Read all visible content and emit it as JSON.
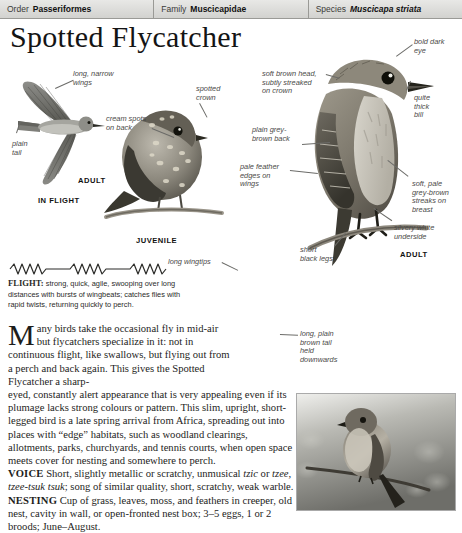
{
  "header": {
    "cells": [
      {
        "label": "Order",
        "value": "Passeriformes",
        "italic": false
      },
      {
        "label": "Family",
        "value": "Muscicapidae",
        "italic": false
      },
      {
        "label": "Species",
        "value": "Muscicapa striata",
        "italic": true
      }
    ]
  },
  "page_title": "Spotted Flycatcher",
  "annotations": {
    "long_narrow_wings": "long, narrow\nwings",
    "plain_tail": "plain\ntail",
    "in_flight": "IN FLIGHT",
    "adult_flight": "ADULT",
    "spotted_crown": "spotted\ncrown",
    "cream_spots_on_back": "cream spots\non back",
    "juvenile": "JUVENILE",
    "bold_dark_eye": "bold dark\neye",
    "soft_brown_head": "soft brown head,\nsubtly streaked\non crown",
    "quite_thick_bill": "quite\nthick\nbill",
    "plain_grey_brown_back": "plain grey-\nbrown back",
    "pale_feather_edges": "pale feather\nedges on\nwings",
    "soft_pale_streaks": "soft, pale\ngrey-brown\nstreaks on\nbreast",
    "silvery_white_underside": "silvery white\nunderside",
    "short_black_legs": "short\nblack legs",
    "adult_perched": "ADULT",
    "long_wingtips": "long wingtips",
    "long_plain_brown_tail": "long, plain\nbrown tail\nheld\ndownwards"
  },
  "flight": {
    "label": "FLIGHT:",
    "text": " strong, quick, agile, swooping over long distances with bursts of wingbeats; catches flies with rapid twists, returning quickly to perch."
  },
  "body": {
    "dropcap": "M",
    "paragraph_1": "any birds take the occasional fly in mid-air but flycatchers specialize in it: not in continuous flight, like swallows, but flying out from a perch and back again. This gives the Spotted Flycatcher a sharp-",
    "paragraph_2": "eyed, constantly alert appearance that is very appealing even if its plumage lacks strong colours or pattern. This slim, upright, short-legged bird is a late spring arrival from Africa, spreading out into places with “edge” habitats, such as woodland clearings, allotments, parks, churchyards, and tennis courts, when open space meets cover for nesting and somewhere to perch.",
    "voice_label": "VOICE",
    "voice_text_a": " Short, slightly metallic or scratchy, unmusical ",
    "voice_italic_a": "tzic",
    "voice_text_b": " or ",
    "voice_italic_b": "tzee, tzee-tsuk tsuk",
    "voice_text_c": "; song of similar quality, short, scratchy, weak warble.",
    "nesting_label": "NESTING",
    "nesting_text": " Cup of grass, leaves, moss, and feathers in creeper, old nest, cavity in wall, or open-fronted nest box; 3–5 eggs, 1 or 2 broods; June–August."
  },
  "colors": {
    "header_bg": "#dedede",
    "ink": "#1a1a1a",
    "annotation": "#4a4a48"
  }
}
